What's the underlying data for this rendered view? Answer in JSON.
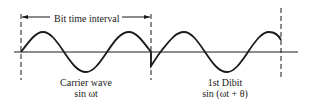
{
  "diagram": {
    "interval_label": "Bit time interval",
    "carrier": {
      "title": "Carrier wave",
      "formula": "sin ωt"
    },
    "dibit": {
      "title": "1st Dibit",
      "formula": "sin (ωt + θ)"
    },
    "colors": {
      "stroke": "#1a1a1a",
      "background": "#ffffff"
    }
  }
}
